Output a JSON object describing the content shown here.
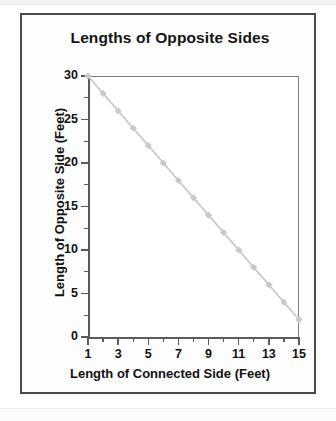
{
  "figure": {
    "title": "Lengths of Opposite Sides",
    "frame_color": "#4a4a4a",
    "background": "#ffffff"
  },
  "chart_data": {
    "type": "line",
    "title": "Lengths of Opposite Sides",
    "xlabel": "Length of Connected Side (Feet)",
    "ylabel": "Length of Opposite Side (Feet)",
    "xlim": [
      1,
      15
    ],
    "ylim": [
      0,
      30
    ],
    "grid": false,
    "legend": null,
    "marker": "diamond",
    "marker_color": "#c9c9c9",
    "line_color": "#c4c4c4",
    "x": [
      1,
      2,
      3,
      4,
      5,
      6,
      7,
      8,
      9,
      10,
      11,
      12,
      13,
      14,
      15
    ],
    "values": [
      30,
      28,
      26,
      24,
      22,
      20,
      18,
      16,
      14,
      12,
      10,
      8,
      6,
      4,
      2
    ],
    "xticks_major": [
      1,
      3,
      5,
      7,
      9,
      11,
      13,
      15
    ],
    "xticks_minor": [
      2,
      4,
      6,
      8,
      10,
      12,
      14
    ],
    "xtick_labels": [
      "1",
      "3",
      "5",
      "7",
      "9",
      "11",
      "13",
      "15"
    ],
    "yticks_major": [
      0,
      5,
      10,
      15,
      20,
      25,
      30
    ],
    "yticks_minor": [
      2.5,
      7.5,
      12.5,
      17.5,
      22.5,
      27.5
    ],
    "ytick_labels": [
      "0",
      "5",
      "10",
      "15",
      "20",
      "25",
      "30"
    ]
  }
}
